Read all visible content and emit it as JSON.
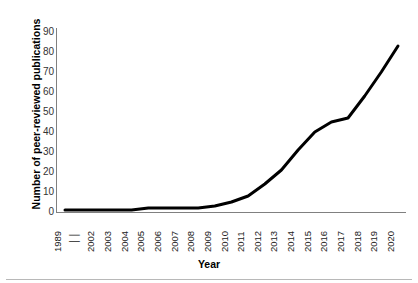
{
  "chart_data": {
    "type": "line",
    "title": "",
    "xlabel": "Year",
    "ylabel": "Number of peer-reviewed publications",
    "categories": [
      "1989",
      "││",
      "2002",
      "2003",
      "2004",
      "2005",
      "2006",
      "2007",
      "2008",
      "2009",
      "2010",
      "2011",
      "2012",
      "2013",
      "2014",
      "2015",
      "2016",
      "2017",
      "2018",
      "2019",
      "2020"
    ],
    "x_tick_labels": [
      "1989",
      "││",
      "2002",
      "2003",
      "2004",
      "2005",
      "2006",
      "2007",
      "2008",
      "2009",
      "2010",
      "2011",
      "2012",
      "2013",
      "2014",
      "2015",
      "2016",
      "2017",
      "2018",
      "2019",
      "2020"
    ],
    "axis_break_after_index": 0,
    "values": [
      1,
      null,
      1,
      1,
      1,
      2,
      2,
      2,
      2,
      3,
      5,
      8,
      14,
      21,
      31,
      40,
      45,
      47,
      58,
      70,
      83
    ],
    "series": [
      {
        "name": "Number of peer-reviewed publications",
        "color": "#000000",
        "values": [
          1,
          null,
          1,
          1,
          1,
          2,
          2,
          2,
          2,
          3,
          5,
          8,
          14,
          21,
          31,
          40,
          45,
          47,
          58,
          70,
          83
        ]
      }
    ],
    "y_tick_labels": [
      "90",
      "80",
      "70",
      "60",
      "50",
      "40",
      "30",
      "20",
      "10",
      "0"
    ],
    "y_ticks": [
      90,
      80,
      70,
      60,
      50,
      40,
      30,
      20,
      10,
      0
    ],
    "ylim": [
      0,
      90
    ],
    "xlim_labels": [
      "1989",
      "2020"
    ],
    "grid": false,
    "legend": false,
    "legend_position": "none",
    "line_color": "#000000",
    "line_width_px": 3,
    "background_color": "#ffffff",
    "axis_color": "#808080"
  },
  "axes": {
    "y_title": "Number of peer-reviewed publications",
    "x_title": "Year"
  }
}
